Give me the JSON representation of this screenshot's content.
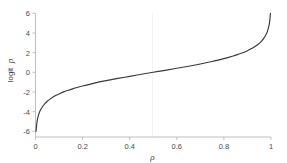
{
  "chart_data": {
    "type": "line",
    "title": "",
    "subtitle": "",
    "xlabel": "ρ",
    "ylabel": "logit p",
    "xlim": [
      0,
      1
    ],
    "ylim": [
      -6,
      6
    ],
    "xticks": [
      0,
      0.2,
      0.4,
      0.6,
      0.8,
      1
    ],
    "xticklabels": [
      "0",
      "0.2",
      "0.4",
      "0.6",
      "0.8",
      "1"
    ],
    "yticks": [
      -6,
      -4,
      -2,
      0,
      2,
      4,
      6
    ],
    "yticklabels": [
      "-6",
      "-4",
      "-2",
      "0",
      "2",
      "4",
      "6"
    ],
    "grid": "faint vertical gridline at x=0.5",
    "legend": null,
    "annotations": [],
    "series": [
      {
        "name": "logit(ρ)",
        "color": "#3a3a3a",
        "linewidth": 1.15,
        "x": [
          0.0025,
          0.005,
          0.0075,
          0.01,
          0.015,
          0.02,
          0.03,
          0.04,
          0.05,
          0.06,
          0.07,
          0.08,
          0.09,
          0.1,
          0.12,
          0.14,
          0.16,
          0.18,
          0.2,
          0.25,
          0.3,
          0.35,
          0.4,
          0.45,
          0.5,
          0.55,
          0.6,
          0.65,
          0.7,
          0.75,
          0.8,
          0.82,
          0.84,
          0.86,
          0.88,
          0.9,
          0.91,
          0.92,
          0.93,
          0.94,
          0.95,
          0.96,
          0.97,
          0.98,
          0.985,
          0.99,
          0.9925,
          0.995,
          0.9975
        ],
        "y": [
          -5.99,
          -5.29,
          -4.89,
          -4.6,
          -4.19,
          -3.89,
          -3.48,
          -3.18,
          -2.94,
          -2.75,
          -2.59,
          -2.44,
          -2.31,
          -2.2,
          -1.99,
          -1.82,
          -1.66,
          -1.52,
          -1.39,
          -1.1,
          -0.85,
          -0.62,
          -0.41,
          -0.2,
          0.0,
          0.2,
          0.41,
          0.62,
          0.85,
          1.1,
          1.39,
          1.52,
          1.66,
          1.82,
          1.99,
          2.2,
          2.31,
          2.44,
          2.59,
          2.75,
          2.94,
          3.18,
          3.48,
          3.89,
          4.19,
          4.6,
          4.89,
          5.29,
          5.99
        ]
      }
    ]
  },
  "axes": {
    "x_title": "ρ",
    "y_title": "logit p",
    "y_title_prefix": "logit ",
    "y_title_var": "p"
  },
  "colors": {
    "background": "#ffffff",
    "curve": "#3a3a3a",
    "spine": "#b9b9b9",
    "tick_text": "#4a4a4a",
    "gridline": "#f0f0f0"
  }
}
